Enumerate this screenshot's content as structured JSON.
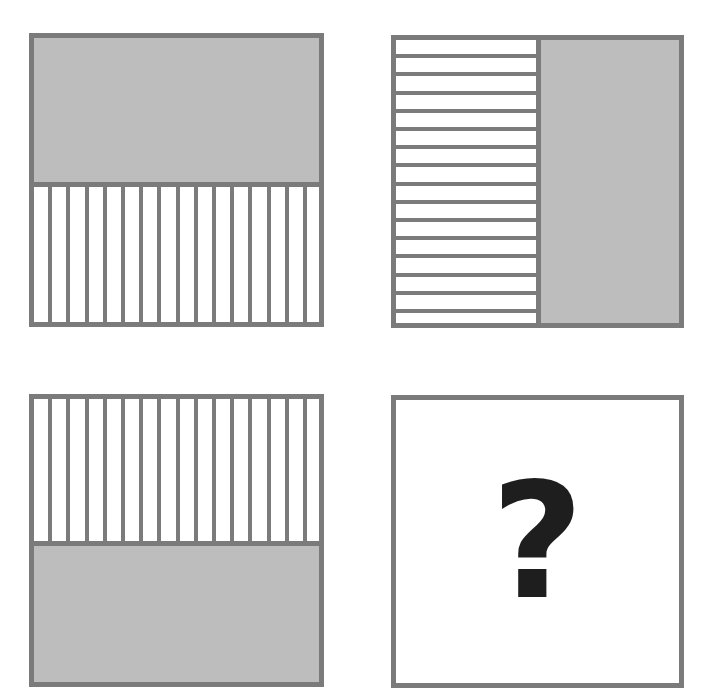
{
  "puzzle": {
    "panels": [
      {
        "id": "top-left",
        "layout": "horizontal-split",
        "top": "solid-gray",
        "bottom": "vertical-stripes",
        "stripe_lines": 15
      },
      {
        "id": "top-right",
        "layout": "vertical-split",
        "left": "horizontal-stripes",
        "right": "solid-gray",
        "stripe_lines": 15
      },
      {
        "id": "bottom-left",
        "layout": "horizontal-split",
        "top": "vertical-stripes",
        "bottom": "solid-gray",
        "stripe_lines": 15
      },
      {
        "id": "bottom-right",
        "content": "question-mark"
      }
    ],
    "question_mark": "?",
    "colors": {
      "border": "#7b7b7b",
      "fill_gray": "#bdbdbd",
      "background": "#ffffff",
      "question_mark": "#1e1e1e"
    }
  }
}
